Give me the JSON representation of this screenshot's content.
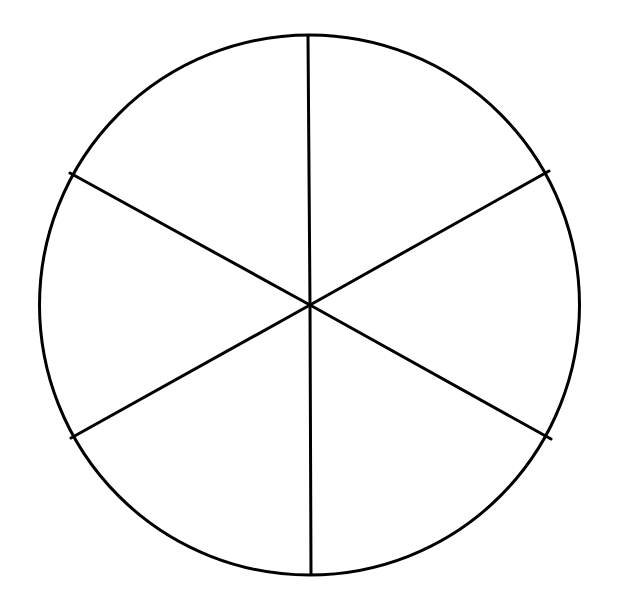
{
  "diagram": {
    "type": "circle-divided-into-sectors",
    "sector_count": 6,
    "background_color": "#ffffff",
    "stroke_color": "#000000",
    "stroke_width": 3,
    "circle": {
      "cx": 309.5,
      "cy": 305,
      "r": 270
    },
    "spokes": [
      {
        "name": "top",
        "x2": 308,
        "y2": 36
      },
      {
        "name": "upper-right",
        "x2": 549,
        "y2": 171
      },
      {
        "name": "lower-right",
        "x2": 551,
        "y2": 439
      },
      {
        "name": "bottom",
        "x2": 311,
        "y2": 574
      },
      {
        "name": "lower-left",
        "x2": 71,
        "y2": 438
      },
      {
        "name": "upper-left",
        "x2": 70,
        "y2": 173
      }
    ],
    "center": {
      "x": 310,
      "y": 305
    },
    "labels": []
  }
}
